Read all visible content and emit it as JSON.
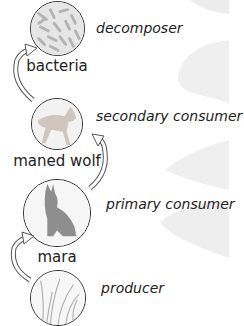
{
  "diagram": {
    "type": "food-chain",
    "levels": [
      {
        "organism": "bacteria",
        "role": "decomposer",
        "icon": "bacteria-icon"
      },
      {
        "organism": "maned wolf",
        "role": "secondary consumer",
        "icon": "maned-wolf-icon"
      },
      {
        "organism": "mara",
        "role": "primary consumer",
        "icon": "mara-icon"
      },
      {
        "organism": "",
        "role": "producer",
        "icon": "grass-icon"
      }
    ],
    "arrows": [
      {
        "from": "producer",
        "to": "mara"
      },
      {
        "from": "mara",
        "to": "maned wolf"
      },
      {
        "from": "maned wolf",
        "to": "bacteria"
      }
    ]
  }
}
